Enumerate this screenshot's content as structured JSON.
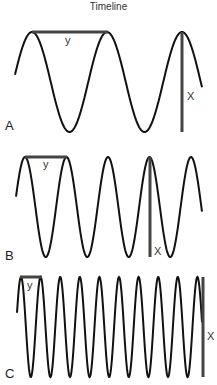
{
  "title": "Timeline",
  "panels": [
    {
      "letter": "A",
      "wavelength_label": "y",
      "amplitude_label": "X",
      "cycles_visible": 2.5
    },
    {
      "letter": "B",
      "wavelength_label": "y",
      "amplitude_label": "X",
      "cycles_visible": 4.5
    },
    {
      "letter": "C",
      "wavelength_label": "y",
      "amplitude_label": "X",
      "cycles_visible": 9.5
    }
  ],
  "colors": {
    "wave": "#111111",
    "marker": "#444444",
    "text": "#333333"
  }
}
